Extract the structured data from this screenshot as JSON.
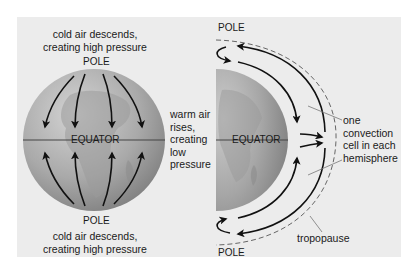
{
  "left_panel": {
    "top_caption_line1": "cold air descends,",
    "top_caption_line2": "creating high pressure",
    "top_pole": "POLE",
    "equator": "EQUATOR",
    "bottom_pole": "POLE",
    "bottom_caption_line1": "cold air descends,",
    "bottom_caption_line2": "creating high pressure"
  },
  "middle": {
    "line1": "warm air",
    "line2": "rises,",
    "line3": "creating",
    "line4": "low",
    "line5": "pressure"
  },
  "right_panel": {
    "top_pole": "POLE",
    "equator": "EQUATOR",
    "bottom_pole": "POLE",
    "cell_label_line1": "one",
    "cell_label_line2": "convection",
    "cell_label_line3": "cell in each",
    "cell_label_line4": "hemisphere",
    "tropopause": "tropopause"
  },
  "colors": {
    "panel_bg": "#ececec",
    "globe_light": "#cfcfcf",
    "globe_dark": "#8a8a8a",
    "arrow": "#111111",
    "dashed": "#666666"
  }
}
